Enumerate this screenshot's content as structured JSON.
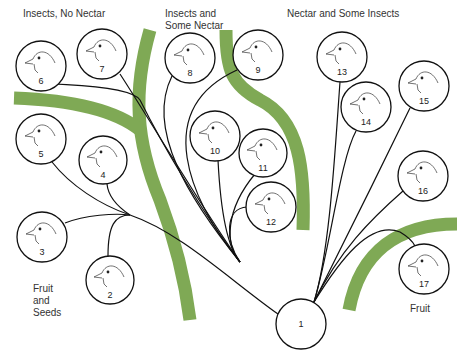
{
  "colors": {
    "divider": "#7fa955",
    "line": "#111111",
    "background": "#ffffff"
  },
  "groups": {
    "insects_no_nectar": "Insects, No Nectar",
    "insects_some_nectar": "Insects and\nSome Nectar",
    "nectar_some_insects": "Nectar and Some Insects",
    "fruit_seeds": "Fruit\nand\nSeeds",
    "fruit": "Fruit"
  },
  "nodes": [
    {
      "id": "1",
      "label": "1",
      "x": 301,
      "y": 324,
      "r": 25,
      "bird": false
    },
    {
      "id": "2",
      "label": "2",
      "x": 110,
      "y": 280,
      "r": 24,
      "bird": true
    },
    {
      "id": "3",
      "label": "3",
      "x": 42,
      "y": 237,
      "r": 25,
      "bird": true
    },
    {
      "id": "4",
      "label": "4",
      "x": 103,
      "y": 160,
      "r": 24,
      "bird": true
    },
    {
      "id": "5",
      "label": "5",
      "x": 41,
      "y": 139,
      "r": 25,
      "bird": true
    },
    {
      "id": "6",
      "label": "6",
      "x": 41,
      "y": 66,
      "r": 25,
      "bird": true
    },
    {
      "id": "7",
      "label": "7",
      "x": 102,
      "y": 54,
      "r": 25,
      "bird": true
    },
    {
      "id": "8",
      "label": "8",
      "x": 190,
      "y": 58,
      "r": 25,
      "bird": true
    },
    {
      "id": "9",
      "label": "9",
      "x": 258,
      "y": 55,
      "r": 25,
      "bird": true
    },
    {
      "id": "10",
      "label": "10",
      "x": 215,
      "y": 136,
      "r": 25,
      "bird": true
    },
    {
      "id": "11",
      "label": "11",
      "x": 263,
      "y": 153,
      "r": 24,
      "bird": true
    },
    {
      "id": "12",
      "label": "12",
      "x": 271,
      "y": 207,
      "r": 25,
      "bird": true
    },
    {
      "id": "13",
      "label": "13",
      "x": 342,
      "y": 57,
      "r": 25,
      "bird": true
    },
    {
      "id": "14",
      "label": "14",
      "x": 366,
      "y": 107,
      "r": 25,
      "bird": true
    },
    {
      "id": "15",
      "label": "15",
      "x": 424,
      "y": 86,
      "r": 25,
      "bird": true
    },
    {
      "id": "16",
      "label": "16",
      "x": 423,
      "y": 176,
      "r": 25,
      "bird": true
    },
    {
      "id": "17",
      "label": "17",
      "x": 424,
      "y": 269,
      "r": 25,
      "bird": true
    }
  ]
}
